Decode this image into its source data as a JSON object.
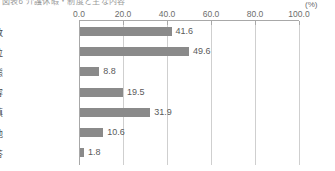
{
  "title": "図表6 介護休暇・制度と主な内容",
  "axis": {
    "unit": "(%)",
    "ticks": [
      "0.0",
      "20.0",
      "40.0",
      "60.0",
      "80.0",
      "100.0"
    ]
  },
  "chart_data": {
    "type": "bar",
    "orientation": "horizontal",
    "title": "図表6 介護休暇・制度と主な内容",
    "xlabel": "(%)",
    "ylabel": "",
    "xlim": [
      0,
      100
    ],
    "grid": true,
    "axis_position": "top",
    "legend": "none",
    "bar_color": "#8a8a8a",
    "categories": [
      "取得日数",
      "取得単位",
      "要介護の状態",
      "対象家族内容",
      "賃金補填",
      "その他",
      "無回答"
    ],
    "values": [
      41.6,
      49.6,
      8.8,
      19.5,
      31.9,
      10.6,
      1.8
    ],
    "value_labels": [
      "41.6",
      "49.6",
      "8.8",
      "19.5",
      "31.9",
      "10.6",
      "1.8"
    ],
    "tick_labels": [
      "0.0",
      "20.0",
      "40.0",
      "60.0",
      "80.0",
      "100.0"
    ],
    "tick_values": [
      0,
      20,
      40,
      60,
      80,
      100
    ]
  }
}
